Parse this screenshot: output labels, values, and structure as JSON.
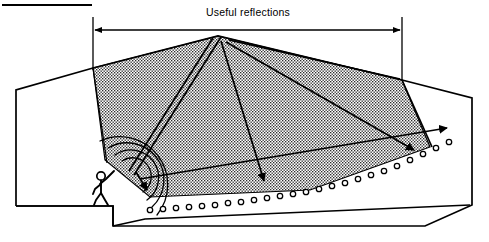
{
  "figure": {
    "title": "Useful reflections",
    "caption_rule": "top-left horizontal rule"
  },
  "dimension": {
    "label": "Useful reflections",
    "label_x": 248,
    "label_y": 16,
    "arrow_y": 30,
    "left_x": 93,
    "right_x": 402,
    "left_ext_top": 17,
    "left_ext_bottom": 70,
    "right_ext_top": 17,
    "right_ext_bottom": 82
  },
  "rule": {
    "x1": 2,
    "y1": 5,
    "x2": 92,
    "y2": 5
  },
  "colors": {
    "ink": "#000000",
    "paper": "#ffffff",
    "stipple": "#9a9a9a"
  },
  "room": {
    "outline_points": "16,90 93,68 218,36 402,80 472,98 472,205 425,226 113,226 113,206 16,206",
    "ceiling_apex": {
      "x": 218,
      "y": 36
    },
    "ceiling_left_break": {
      "x": 93,
      "y": 68
    },
    "ceiling_right_break": {
      "x": 402,
      "y": 80
    },
    "rear_wall_top": {
      "x": 472,
      "y": 98
    },
    "rear_wall_bottom": {
      "x": 472,
      "y": 205
    },
    "front_wall_x": 16
  },
  "stage": {
    "platform_top_y": 206,
    "platform_edge_x": 113,
    "floor_y": 226,
    "label": "platform"
  },
  "source": {
    "x": 135,
    "y": 176,
    "label": "sound source"
  },
  "reflection_zone": {
    "label": "useful reflection zone",
    "polygon": "93,68 218,36 402,80 430,146 150,196 105,160",
    "fill": "stipple"
  },
  "wavefronts": {
    "count": 4,
    "label": "direct sound wavefronts",
    "radii": [
      17,
      27,
      37,
      48
    ],
    "center_x": 133,
    "center_y": 178
  },
  "rays": [
    {
      "id": "ray-direct-down",
      "label": "direct sound to front stalls",
      "path": "M 136,172 L 148,191",
      "arrow": {
        "x": 148,
        "y": 196,
        "angle": 56
      }
    },
    {
      "id": "ray-ceiling-incident-left",
      "label": "incident ray to ceiling apex",
      "path": "M 131,170 L 214,38",
      "arrow": null
    },
    {
      "id": "ray-ceiling-reflect-mid",
      "label": "ceiling reflection to mid stalls",
      "path": "M 221,40 L 264,182",
      "arrow": {
        "x": 266,
        "y": 188,
        "angle": 73
      }
    },
    {
      "id": "ray-ceiling-incident-right",
      "label": "second incident ray to ceiling apex",
      "path": "M 134,174 L 222,37",
      "arrow": null
    },
    {
      "id": "ray-ceiling-reflect-rear",
      "label": "ceiling reflection to rear stalls",
      "path": "M 225,41 L 414,150",
      "arrow": {
        "x": 419,
        "y": 153,
        "angle": 30
      }
    },
    {
      "id": "ray-sidewall-long",
      "label": "long reflection to rear seats",
      "path": "M 139,178 L 447,128",
      "arrow": {
        "x": 452,
        "y": 127,
        "angle": -9
      }
    },
    {
      "id": "ray-upper-wall",
      "label": "upper wall ray from apex to right wall",
      "path": "M 230,40 L 400,79",
      "arrow": null
    },
    {
      "id": "ray-left-wall-edge",
      "label": "ceiling edge ray at left break",
      "path": "M 93,68 L 107,162",
      "arrow": null
    },
    {
      "id": "ray-right-wall-edge",
      "label": "ceiling edge ray at right break",
      "path": "M 402,80 L 432,147",
      "arrow": null
    }
  ],
  "seats": {
    "label": "audience seats",
    "radius": 2.7,
    "count": 22,
    "positions": [
      {
        "x": 150,
        "y": 210
      },
      {
        "x": 163,
        "y": 209
      },
      {
        "x": 176,
        "y": 208
      },
      {
        "x": 189,
        "y": 207
      },
      {
        "x": 202,
        "y": 206
      },
      {
        "x": 215,
        "y": 205
      },
      {
        "x": 228,
        "y": 203
      },
      {
        "x": 241,
        "y": 202
      },
      {
        "x": 254,
        "y": 200
      },
      {
        "x": 267,
        "y": 198
      },
      {
        "x": 280,
        "y": 196
      },
      {
        "x": 293,
        "y": 194
      },
      {
        "x": 306,
        "y": 192
      },
      {
        "x": 319,
        "y": 189
      },
      {
        "x": 332,
        "y": 186
      },
      {
        "x": 345,
        "y": 183
      },
      {
        "x": 358,
        "y": 179
      },
      {
        "x": 371,
        "y": 175
      },
      {
        "x": 384,
        "y": 171
      },
      {
        "x": 397,
        "y": 166
      },
      {
        "x": 410,
        "y": 160
      },
      {
        "x": 423,
        "y": 154
      },
      {
        "x": 436,
        "y": 148
      },
      {
        "x": 449,
        "y": 142
      }
    ]
  },
  "person": {
    "label": "speaker on platform",
    "head": {
      "cx": 101,
      "cy": 176,
      "r": 4.2
    },
    "body": "M 101,181 L 101,193",
    "arm_raised": "M 101,184 L 113,172",
    "arm_down": "M 101,184 L 93,190",
    "leg_left": "M 101,193 L 95,205",
    "leg_right": "M 101,193 L 107,205",
    "base_y": 206
  }
}
